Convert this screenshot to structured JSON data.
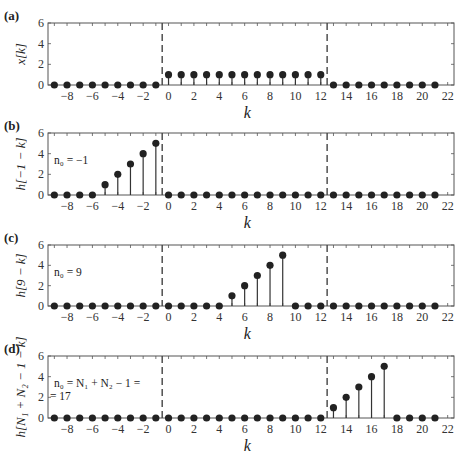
{
  "chart_data": [
    {
      "type": "stem",
      "panel_label": "(a)",
      "ylabel": "x[k]",
      "xlabel": "k",
      "xlim": [
        -9.5,
        22.5
      ],
      "ylim": [
        0,
        6
      ],
      "xticks": [
        -8,
        -6,
        -4,
        -2,
        0,
        2,
        4,
        6,
        8,
        10,
        12,
        14,
        16,
        18,
        20,
        22
      ],
      "yticks": [
        0,
        2,
        4,
        6
      ],
      "dashed_lines_at": [
        -0.5,
        12.5
      ],
      "annotation": "",
      "x": [
        -9,
        -8,
        -7,
        -6,
        -5,
        -4,
        -3,
        -2,
        -1,
        0,
        1,
        2,
        3,
        4,
        5,
        6,
        7,
        8,
        9,
        10,
        11,
        12,
        13,
        14,
        15,
        16,
        17,
        18,
        19,
        20,
        21
      ],
      "values": [
        0,
        0,
        0,
        0,
        0,
        0,
        0,
        0,
        0,
        1,
        1,
        1,
        1,
        1,
        1,
        1,
        1,
        1,
        1,
        1,
        1,
        1,
        0,
        0,
        0,
        0,
        0,
        0,
        0,
        0,
        0
      ]
    },
    {
      "type": "stem",
      "panel_label": "(b)",
      "ylabel": "h[−1 − k]",
      "xlabel": "k",
      "xlim": [
        -9.5,
        22.5
      ],
      "ylim": [
        0,
        6
      ],
      "xticks": [
        -8,
        -6,
        -4,
        -2,
        0,
        2,
        4,
        6,
        8,
        10,
        12,
        14,
        16,
        18,
        20,
        22
      ],
      "yticks": [
        0,
        2,
        4,
        6
      ],
      "dashed_lines_at": [
        -0.5,
        12.5
      ],
      "annotation": "n₀ = −1",
      "x": [
        -9,
        -8,
        -7,
        -6,
        -5,
        -4,
        -3,
        -2,
        -1,
        0,
        1,
        2,
        3,
        4,
        5,
        6,
        7,
        8,
        9,
        10,
        11,
        12,
        13,
        14,
        15,
        16,
        17,
        18,
        19,
        20,
        21
      ],
      "values": [
        0,
        0,
        0,
        0,
        1,
        2,
        3,
        4,
        5,
        0,
        0,
        0,
        0,
        0,
        0,
        0,
        0,
        0,
        0,
        0,
        0,
        0,
        0,
        0,
        0,
        0,
        0,
        0,
        0,
        0,
        0
      ]
    },
    {
      "type": "stem",
      "panel_label": "(c)",
      "ylabel": "h[9 − k]",
      "xlabel": "k",
      "xlim": [
        -9.5,
        22.5
      ],
      "ylim": [
        0,
        6
      ],
      "xticks": [
        -8,
        -6,
        -4,
        -2,
        0,
        2,
        4,
        6,
        8,
        10,
        12,
        14,
        16,
        18,
        20,
        22
      ],
      "yticks": [
        0,
        2,
        4,
        6
      ],
      "dashed_lines_at": [
        -0.5,
        12.5
      ],
      "annotation": "n₀ = 9",
      "x": [
        -9,
        -8,
        -7,
        -6,
        -5,
        -4,
        -3,
        -2,
        -1,
        0,
        1,
        2,
        3,
        4,
        5,
        6,
        7,
        8,
        9,
        10,
        11,
        12,
        13,
        14,
        15,
        16,
        17,
        18,
        19,
        20,
        21
      ],
      "values": [
        0,
        0,
        0,
        0,
        0,
        0,
        0,
        0,
        0,
        0,
        0,
        0,
        0,
        0,
        1,
        2,
        3,
        4,
        5,
        0,
        0,
        0,
        0,
        0,
        0,
        0,
        0,
        0,
        0,
        0,
        0
      ]
    },
    {
      "type": "stem",
      "panel_label": "(d)",
      "ylabel": "h[N₁ + N₂ − 1 − k]",
      "xlabel": "k",
      "xlim": [
        -9.5,
        22.5
      ],
      "ylim": [
        0,
        6
      ],
      "xticks": [
        -8,
        -6,
        -4,
        -2,
        0,
        2,
        4,
        6,
        8,
        10,
        12,
        14,
        16,
        18,
        20,
        22
      ],
      "yticks": [
        0,
        2,
        4,
        6
      ],
      "dashed_lines_at": [
        -0.5,
        12.5
      ],
      "annotation": "n₀ = N₁ + N₂ − 1 =",
      "annotation_line2": "= 17",
      "x": [
        -9,
        -8,
        -7,
        -6,
        -5,
        -4,
        -3,
        -2,
        -1,
        0,
        1,
        2,
        3,
        4,
        5,
        6,
        7,
        8,
        9,
        10,
        11,
        12,
        13,
        14,
        15,
        16,
        17,
        18,
        19,
        20,
        21
      ],
      "values": [
        0,
        0,
        0,
        0,
        0,
        0,
        0,
        0,
        0,
        0,
        0,
        0,
        0,
        0,
        0,
        0,
        0,
        0,
        0,
        0,
        0,
        0,
        1,
        2,
        3,
        4,
        5,
        0,
        0,
        0,
        0
      ]
    }
  ]
}
